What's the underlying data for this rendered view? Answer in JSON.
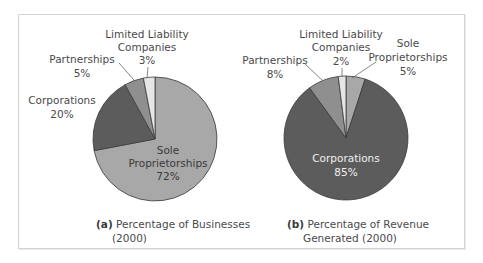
{
  "chart_data": [
    {
      "type": "pie",
      "title": "(a) Percentage of Businesses (2000)",
      "caption_tag": "(a)",
      "caption_line1": "Percentage of Businesses",
      "caption_line2": "(2000)",
      "start_angle": "top, clockwise",
      "slices": [
        {
          "label": "Sole Proprietorships",
          "value": 72,
          "display": "72%",
          "color": "#a8a8a8"
        },
        {
          "label": "Corporations",
          "value": 20,
          "display": "20%",
          "color": "#5c5c5c"
        },
        {
          "label": "Partnerships",
          "value": 5,
          "display": "5%",
          "color": "#8f8f8f"
        },
        {
          "label": "Limited Liability Companies",
          "value": 3,
          "display": "3%",
          "color": "#e6e6e6"
        }
      ]
    },
    {
      "type": "pie",
      "title": "(b) Percentage of Revenue Generated (2000)",
      "caption_tag": "(b)",
      "caption_line1": "Percentage of Revenue",
      "caption_line2": "Generated (2000)",
      "start_angle": "top, clockwise",
      "slices": [
        {
          "label": "Sole Proprietorships",
          "value": 5,
          "display": "5%",
          "color": "#a8a8a8"
        },
        {
          "label": "Corporations",
          "value": 85,
          "display": "85%",
          "color": "#5c5c5c"
        },
        {
          "label": "Partnerships",
          "value": 8,
          "display": "8%",
          "color": "#8f8f8f"
        },
        {
          "label": "Limited Liability Companies",
          "value": 2,
          "display": "2%",
          "color": "#e6e6e6"
        }
      ]
    }
  ],
  "labels": {
    "a": {
      "llc_line1": "Limited Liability",
      "llc_line2": "Companies",
      "llc_pct": "3%",
      "partnerships": "Partnerships",
      "partnerships_pct": "5%",
      "corporations": "Corporations",
      "corporations_pct": "20%",
      "sole_line1": "Sole",
      "sole_line2": "Proprietorships",
      "sole_pct": "72%"
    },
    "b": {
      "llc_line1": "Limited Liability",
      "llc_line2": "Companies",
      "llc_pct": "2%",
      "partnerships": "Partnerships",
      "partnerships_pct": "8%",
      "sole_line1": "Sole",
      "sole_line2": "Proprietorships",
      "sole_pct": "5%",
      "corporations": "Corporations",
      "corporations_pct": "85%"
    }
  },
  "colors": {
    "frame_border": "#d4d4d4",
    "text": "#4a4a4a",
    "slice_outline": "#3a3a3a",
    "leader_line": "#6a6a6a"
  }
}
